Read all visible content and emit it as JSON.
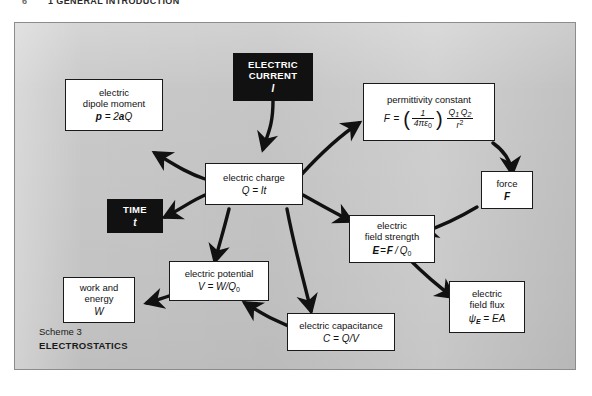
{
  "page": {
    "number": "6",
    "running_title": "1 GENERAL INTRODUCTION"
  },
  "figure": {
    "caption_line1": "Scheme 3",
    "caption_line2": "ELECTROSTATICS",
    "background_color": "#c9c9c9",
    "border_color": "#8c8c8c"
  },
  "nodes": {
    "electric_current": {
      "label_line1": "ELECTRIC",
      "label_line2": "CURRENT",
      "symbol": "I",
      "style": "black"
    },
    "electric_dipole_moment": {
      "label_line1": "electric",
      "label_line2": "dipole moment",
      "equation": "p = 2aQ"
    },
    "permittivity_constant": {
      "label": "permittivity constant",
      "equation": "F = (1/4πε₀) Q₁Q₂/r²",
      "eq_lhs": "F =",
      "eq_frac_num": "1",
      "eq_frac_den": "4πε",
      "eq_frac_den_sub": "0",
      "eq_q1": "Q",
      "eq_q1_sub": "1",
      "eq_q2": "Q",
      "eq_q2_sub": "2",
      "eq_r": "r",
      "eq_r_sup": "2"
    },
    "electric_charge": {
      "label": "electric charge",
      "equation": "Q = It"
    },
    "time": {
      "label": "TIME",
      "symbol": "t",
      "style": "black"
    },
    "force": {
      "label": "force",
      "symbol": "F"
    },
    "electric_field_strength": {
      "label_line1": "electric",
      "label_line2": "field strength",
      "equation": "E = F / Q₀"
    },
    "electric_potential": {
      "label": "electric potential",
      "equation": "V = W/Q₀"
    },
    "work_and_energy": {
      "label_line1": "work and",
      "label_line2": "energy",
      "symbol": "W"
    },
    "electric_capacitance": {
      "label": "electric capacitance",
      "equation": "C = Q/V"
    },
    "electric_field_flux": {
      "label_line1": "electric",
      "label_line2": "field flux",
      "equation": "ψₑ = EA"
    }
  }
}
